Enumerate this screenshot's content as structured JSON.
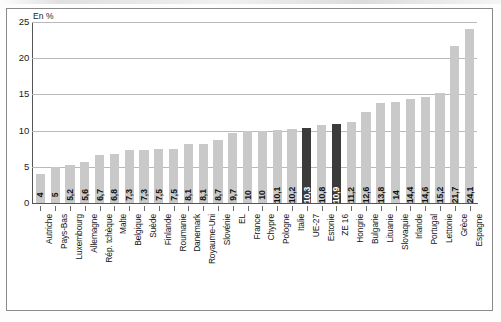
{
  "chart_data": {
    "type": "bar",
    "title": "",
    "subtitle": "",
    "unit_label": "En %",
    "xlabel": "",
    "ylabel": "",
    "ylim": [
      0,
      25
    ],
    "yticks": [
      25,
      20,
      15,
      10,
      5,
      0
    ],
    "grid": true,
    "legend": "none",
    "orientation": "vertical",
    "value_label_orientation": "rotated-90",
    "colors": {
      "bar": "#c9c9c9",
      "bar_highlight": "#3b3b3b",
      "value_label": "#111111",
      "value_label_highlight": "#ffffff",
      "gridline": "#b9b9b9",
      "axis": "#555555",
      "frame": "#8a8a8a",
      "background": "#ffffff"
    },
    "categories": [
      "Autriche",
      "Pays-Bas",
      "Luxembourg",
      "Allemagne",
      "Rép. tchèque",
      "Malte",
      "Belgique",
      "Suède",
      "Finlande",
      "Roumanie",
      "Danemark",
      "Royaume-Uni",
      "Slovénie",
      "EL",
      "France",
      "Chypre",
      "Pologne",
      "Italie",
      "UE-27",
      "Estonie",
      "ZE 16",
      "Hongrie",
      "Bulgarie",
      "Lituanie",
      "Slovaquie",
      "Irlande",
      "Portugal",
      "Lettonie",
      "Grèce",
      "Espagne"
    ],
    "values": [
      4,
      5,
      5.2,
      5.6,
      6.7,
      6.8,
      7.3,
      7.3,
      7.5,
      7.5,
      8.1,
      8.1,
      8.7,
      9.7,
      10,
      10,
      10.1,
      10.2,
      10.3,
      10.8,
      10.9,
      11.2,
      12.6,
      13.8,
      14,
      14.4,
      14.6,
      15.2,
      21.7,
      24.1
    ],
    "value_labels": [
      "4",
      "5",
      "5,2",
      "5,6",
      "6,7",
      "6,8",
      "7,3",
      "7,3",
      "7,5",
      "7,5",
      "8,1",
      "8,1",
      "8,7",
      "9,7",
      "10",
      "10",
      "10,1",
      "10,2",
      "10,3",
      "10,8",
      "10,9",
      "11,2",
      "12,6",
      "13,8",
      "14",
      "14,4",
      "14,6",
      "15,2",
      "21,7",
      "24,1"
    ],
    "highlighted": [
      false,
      false,
      false,
      false,
      false,
      false,
      false,
      false,
      false,
      false,
      false,
      false,
      false,
      false,
      false,
      false,
      false,
      false,
      true,
      false,
      true,
      false,
      false,
      false,
      false,
      false,
      false,
      false,
      false,
      false
    ]
  }
}
